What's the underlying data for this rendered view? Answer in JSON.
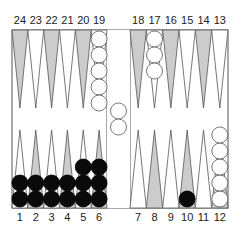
{
  "game": "backgammon",
  "colors": {
    "board_bg": "#ffffff",
    "line": "#555555",
    "point_dark": "#cccccc",
    "point_light": "#ffffff",
    "checker_white": "#ffffff",
    "checker_black": "#0a0a0a"
  },
  "labels": {
    "top": [
      "24",
      "23",
      "22",
      "21",
      "20",
      "19",
      "18",
      "17",
      "16",
      "15",
      "14",
      "13"
    ],
    "bottom": [
      "1",
      "2",
      "3",
      "4",
      "5",
      "6",
      "7",
      "8",
      "9",
      "10",
      "11",
      "12"
    ]
  },
  "points": [
    {
      "point": 1,
      "color": "black",
      "count": 2
    },
    {
      "point": 2,
      "color": "black",
      "count": 2
    },
    {
      "point": 3,
      "color": "black",
      "count": 2
    },
    {
      "point": 4,
      "color": "black",
      "count": 2
    },
    {
      "point": 5,
      "color": "black",
      "count": 3
    },
    {
      "point": 6,
      "color": "black",
      "count": 3
    },
    {
      "point": 10,
      "color": "black",
      "count": 1
    },
    {
      "point": 12,
      "color": "white",
      "count": 5
    },
    {
      "point": 17,
      "color": "white",
      "count": 3
    },
    {
      "point": 19,
      "color": "white",
      "count": 5
    }
  ],
  "bar": {
    "white": 2,
    "black": 0
  }
}
